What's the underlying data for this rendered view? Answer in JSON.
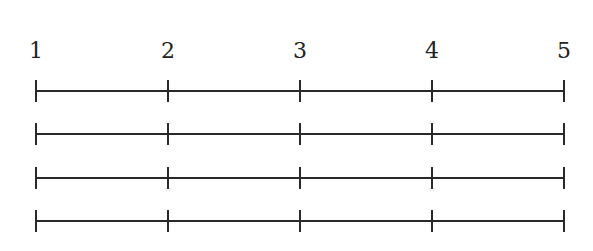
{
  "diagram": {
    "type": "number-line-rows",
    "tick_labels": [
      "1",
      "2",
      "3",
      "4",
      "5"
    ],
    "row_count": 4,
    "colors": {
      "stroke": "#2a2a2a",
      "text": "#222222",
      "background": "#ffffff"
    }
  }
}
